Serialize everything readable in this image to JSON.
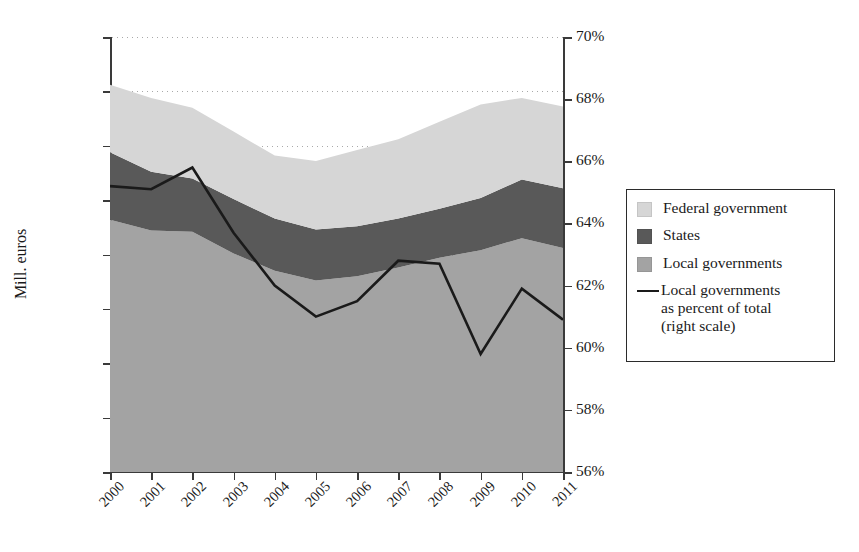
{
  "chart_data": {
    "type": "area",
    "title": "",
    "subtitle": "",
    "xlabel": "",
    "ylabel": "Mill. euros",
    "y2label": "",
    "categories": [
      "2000",
      "2001",
      "2002",
      "2003",
      "2004",
      "2005",
      "2006",
      "2007",
      "2008",
      "2009",
      "2010",
      "2011"
    ],
    "ylim": [
      0,
      40000
    ],
    "yticks": [
      0,
      5000,
      10000,
      15000,
      20000,
      25000,
      30000,
      35000,
      40000
    ],
    "ytick_labels": [
      "0",
      "5000",
      "10 000",
      "15 000",
      "20 000",
      "25 000",
      "30 000",
      "35 000",
      "40 000"
    ],
    "y2lim": [
      56,
      70
    ],
    "y2ticks": [
      56,
      58,
      60,
      62,
      64,
      66,
      68,
      70
    ],
    "y2tick_labels": [
      "56%",
      "58%",
      "60%",
      "62%",
      "64%",
      "66%",
      "68%",
      "70%"
    ],
    "grid": true,
    "grid_style": "dotted-horizontal",
    "legend_position": "right-outside",
    "stacking": "stacked-area-bottom-to-top",
    "series": [
      {
        "name": "Local governments",
        "kind": "area",
        "stack_order": 1,
        "color": "#a3a3a3",
        "values": [
          23200,
          22200,
          22100,
          20100,
          18500,
          17600,
          18000,
          18800,
          19700,
          20400,
          21500,
          20600
        ]
      },
      {
        "name": "States",
        "kind": "area",
        "stack_order": 2,
        "color": "#595959",
        "values": [
          6200,
          5400,
          4900,
          5000,
          4800,
          4700,
          4600,
          4500,
          4500,
          4800,
          5400,
          5500
        ]
      },
      {
        "name": "Federal government",
        "kind": "area",
        "stack_order": 3,
        "color": "#d6d6d6",
        "values": [
          6200,
          6800,
          6500,
          6200,
          5800,
          6300,
          7000,
          7300,
          8000,
          8600,
          7500,
          7500
        ]
      },
      {
        "name": "Local governments as percent of total (right scale)",
        "kind": "line",
        "axis": "right",
        "color": "#1a1a1a",
        "values": [
          65.2,
          65.1,
          65.8,
          63.7,
          62.0,
          61.0,
          61.5,
          62.8,
          62.7,
          59.8,
          61.9,
          60.9
        ]
      }
    ],
    "totals": [
      35600,
      34400,
      33500,
      31300,
      29100,
      28600,
      29600,
      30600,
      32200,
      33800,
      34400,
      33600
    ]
  },
  "legend": {
    "items": [
      {
        "label": "Federal government",
        "marker": "square",
        "color": "#d6d6d6"
      },
      {
        "label": "States",
        "marker": "square",
        "color": "#595959"
      },
      {
        "label": "Local governments",
        "marker": "square",
        "color": "#a3a3a3"
      },
      {
        "label": "Local governments\nas percent of total\n(right scale)",
        "marker": "line",
        "color": "#1a1a1a"
      }
    ],
    "line_item_lines": [
      "Local governments",
      "as percent of total",
      "(right scale)"
    ]
  }
}
